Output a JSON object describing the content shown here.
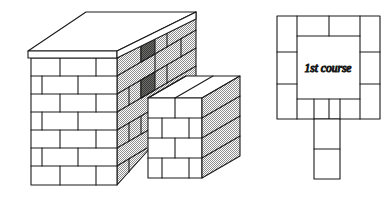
{
  "figure": {
    "background_color": "#ffffff",
    "line_color": "#1a1a1a",
    "hatch_color": "#9a9a9a",
    "dark_brick_color": "#5a5a58",
    "face_color": "#ffffff"
  },
  "isometric": {
    "name": "masonry-pier-isometric",
    "capstone": {
      "label": "cap slab",
      "visible": true
    },
    "pier": {
      "front_face": {
        "courses": 7,
        "shading": "plain-white"
      },
      "side_face": {
        "courses": 7,
        "shading": "hatched-gray"
      }
    },
    "wing_wall": {
      "front_face": {
        "courses": 4,
        "shading": "plain-white"
      },
      "end_face": {
        "shading": "hatched-gray"
      },
      "top_face": {
        "shading": "plain-white"
      }
    },
    "dark_bricks": {
      "count": 2,
      "note": "shaded header units on pier side face"
    }
  },
  "plan": {
    "name": "first-course-plan",
    "label": "1st course",
    "ring_bricks": 12,
    "stem_bricks": 2,
    "center": "hollow core"
  }
}
